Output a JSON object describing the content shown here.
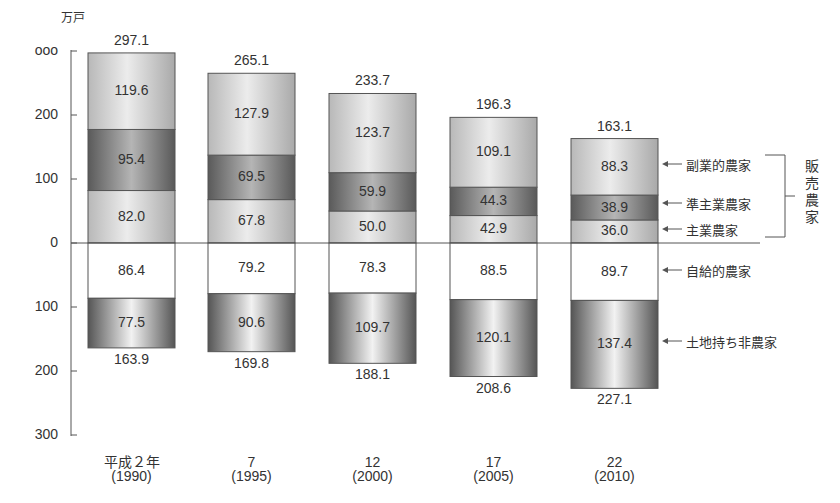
{
  "chart_data": {
    "type": "bar",
    "stacked": true,
    "diverging": true,
    "unit": "万戸",
    "categories": [
      "平成２年\n(1990)",
      "7\n(1995)",
      "12\n(2000)",
      "17\n(2005)",
      "22\n(2010)"
    ],
    "category_labels": [
      {
        "era": "平成２年",
        "year": "(1990)"
      },
      {
        "era": "7",
        "year": "(1995)"
      },
      {
        "era": "12",
        "year": "(2000)"
      },
      {
        "era": "17",
        "year": "(2005)"
      },
      {
        "era": "22",
        "year": "(2010)"
      }
    ],
    "series_above": [
      {
        "name": "主業農家",
        "values": [
          82.0,
          67.8,
          50.0,
          42.9,
          36.0
        ],
        "shade": "light"
      },
      {
        "name": "準主業農家",
        "values": [
          95.4,
          69.5,
          59.9,
          44.3,
          38.9
        ],
        "shade": "dark"
      },
      {
        "name": "副業的農家",
        "values": [
          119.6,
          127.9,
          123.7,
          109.1,
          88.3
        ],
        "shade": "light"
      }
    ],
    "series_below": [
      {
        "name": "自給的農家",
        "values": [
          86.4,
          79.2,
          78.3,
          88.5,
          89.7
        ],
        "shade": "white"
      },
      {
        "name": "土地持ち非農家",
        "values": [
          77.5,
          90.6,
          109.7,
          120.1,
          137.4
        ],
        "shade": "dark"
      }
    ],
    "totals_above": [
      "297.1",
      "265.1",
      "233.7",
      "196.3",
      "163.1"
    ],
    "totals_below": [
      "163.9",
      "169.8",
      "188.1",
      "208.6",
      "227.1"
    ],
    "yaxis": {
      "ticks_above": [
        "ooo",
        "200",
        "100",
        "0"
      ],
      "ticks_below": [
        "100",
        "200",
        "300"
      ],
      "range_above": [
        0,
        300
      ],
      "range_below": [
        0,
        300
      ]
    },
    "group_label": "販売農家",
    "legend": [
      {
        "name": "副業的農家"
      },
      {
        "name": "準主業農家"
      },
      {
        "name": "主業農家"
      },
      {
        "name": "自給的農家"
      },
      {
        "name": "土地持ち非農家"
      }
    ],
    "grid": false,
    "title": "",
    "xlabel": "",
    "ylabel": "万戸"
  }
}
